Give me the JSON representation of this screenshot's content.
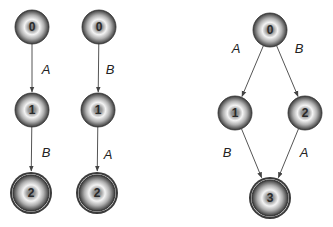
{
  "colors": {
    "node_dark": "#3a3a3a",
    "node_mid": "#8a8a8a",
    "node_light": "#f2f2f2",
    "edge": "#555555",
    "text": "#222222"
  },
  "diagrams": [
    {
      "name": "sequence-A-then-B",
      "nodes": [
        {
          "id": "0",
          "label": "0",
          "x": 32,
          "y": 27,
          "accepting": false
        },
        {
          "id": "1",
          "label": "1",
          "x": 32,
          "y": 110,
          "accepting": false
        },
        {
          "id": "2",
          "label": "2",
          "x": 31,
          "y": 193,
          "accepting": true
        }
      ],
      "edges": [
        {
          "from": "0",
          "to": "1",
          "label": "A",
          "lx": 46,
          "ly": 74
        },
        {
          "from": "1",
          "to": "2",
          "label": "B",
          "lx": 46,
          "ly": 157
        }
      ]
    },
    {
      "name": "sequence-B-then-A",
      "nodes": [
        {
          "id": "0",
          "label": "0",
          "x": 99,
          "y": 27,
          "accepting": false
        },
        {
          "id": "1",
          "label": "1",
          "x": 98,
          "y": 110,
          "accepting": false
        },
        {
          "id": "2",
          "label": "2",
          "x": 97,
          "y": 193,
          "accepting": true
        }
      ],
      "edges": [
        {
          "from": "0",
          "to": "1",
          "label": "B",
          "lx": 110,
          "ly": 74
        },
        {
          "from": "1",
          "to": "2",
          "label": "A",
          "lx": 108,
          "ly": 159
        }
      ]
    },
    {
      "name": "interleaved-diamond",
      "nodes": [
        {
          "id": "0",
          "label": "0",
          "x": 270,
          "y": 30,
          "accepting": false
        },
        {
          "id": "1",
          "label": "1",
          "x": 235,
          "y": 113,
          "accepting": false
        },
        {
          "id": "2",
          "label": "2",
          "x": 305,
          "y": 113,
          "accepting": false
        },
        {
          "id": "3",
          "label": "3",
          "x": 270,
          "y": 198,
          "accepting": true
        }
      ],
      "edges": [
        {
          "from": "0",
          "to": "1",
          "label": "A",
          "lx": 236,
          "ly": 53
        },
        {
          "from": "0",
          "to": "2",
          "label": "B",
          "lx": 299,
          "ly": 53
        },
        {
          "from": "1",
          "to": "3",
          "label": "B",
          "lx": 227,
          "ly": 157
        },
        {
          "from": "2",
          "to": "3",
          "label": "A",
          "lx": 304,
          "ly": 157
        }
      ]
    }
  ]
}
